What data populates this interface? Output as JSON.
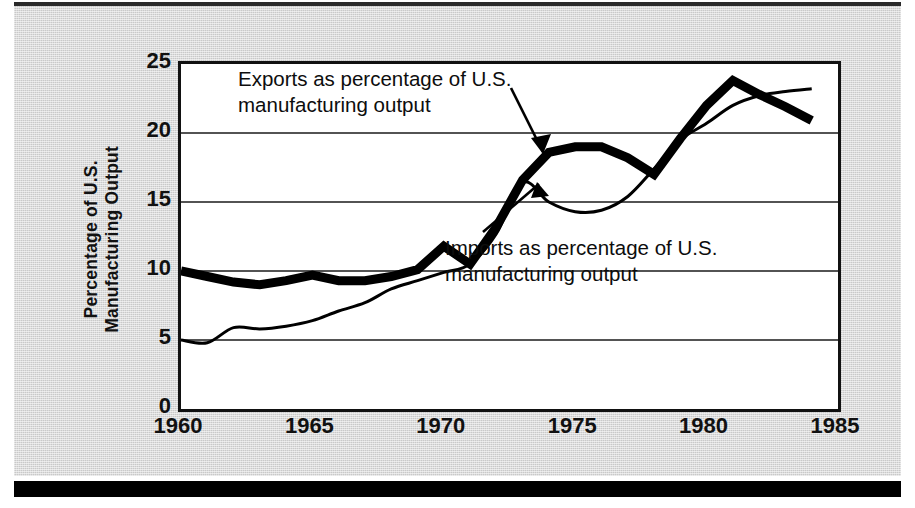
{
  "figure": {
    "background_color": "#c9c9c9",
    "plot_background_color": "#ffffff",
    "rule_color": "#000000"
  },
  "axis": {
    "y_title_line1": "Percentage of U.S.",
    "y_title_line2": "Manufacturing Output",
    "y_ticks": [
      "0",
      "5",
      "10",
      "15",
      "20",
      "25"
    ],
    "x_ticks": [
      "1960",
      "1965",
      "1970",
      "1975",
      "1980",
      "1985"
    ]
  },
  "annotations": {
    "exports_line1": "Exports as percentage of U.S.",
    "exports_line2": "manufacturing output",
    "imports_line1": "Imports as percentage of U.S.",
    "imports_line2": "manufacturing output"
  },
  "chart_data": {
    "type": "line",
    "title": "",
    "xlabel": "",
    "ylabel": "Percentage of U.S. Manufacturing Output",
    "xlim": [
      1960,
      1985
    ],
    "ylim": [
      0,
      25
    ],
    "yticks": [
      0,
      5,
      10,
      15,
      20,
      25
    ],
    "xticks": [
      1960,
      1965,
      1970,
      1975,
      1980,
      1985
    ],
    "grid": "horizontal",
    "legend": "inline-annotations-with-arrows",
    "series": [
      {
        "name": "Exports as percentage of U.S. manufacturing output",
        "style": "thick",
        "color": "#000000",
        "linewidth": 9,
        "x": [
          1960,
          1961,
          1962,
          1963,
          1964,
          1965,
          1966,
          1967,
          1968,
          1969,
          1970,
          1971,
          1972,
          1973,
          1974,
          1975,
          1976,
          1977,
          1978,
          1979,
          1980,
          1981,
          1982,
          1983,
          1984
        ],
        "y": [
          10.0,
          9.6,
          9.2,
          9.0,
          9.3,
          9.7,
          9.3,
          9.3,
          9.6,
          10.1,
          11.8,
          10.5,
          13.2,
          16.6,
          18.6,
          19.0,
          19.0,
          18.2,
          17.0,
          19.6,
          22.0,
          23.8,
          22.8,
          21.9,
          20.9
        ]
      },
      {
        "name": "Imports as percentage of U.S. manufacturing output",
        "style": "thin",
        "color": "#000000",
        "linewidth": 3,
        "x": [
          1960,
          1961,
          1962,
          1963,
          1964,
          1965,
          1966,
          1967,
          1968,
          1969,
          1970,
          1971,
          1972,
          1973,
          1974,
          1975,
          1976,
          1977,
          1978,
          1979,
          1980,
          1981,
          1982,
          1983,
          1984
        ],
        "y": [
          5.0,
          4.8,
          5.9,
          5.8,
          6.0,
          6.4,
          7.1,
          7.7,
          8.7,
          9.3,
          9.9,
          10.5,
          12.7,
          16.4,
          15.0,
          14.3,
          14.4,
          15.4,
          17.4,
          19.5,
          20.7,
          22.0,
          22.7,
          23.0,
          23.2
        ]
      }
    ]
  }
}
